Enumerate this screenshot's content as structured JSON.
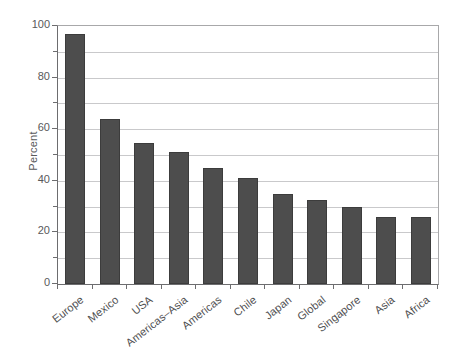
{
  "chart_data": {
    "type": "bar",
    "title": "",
    "subtitle": "",
    "xlabel": "",
    "ylabel": "Percent",
    "categories": [
      "Europe",
      "Mexico",
      "USA",
      "Americas–Asia",
      "Americas",
      "Chile",
      "Japan",
      "Global",
      "Singapore",
      "Asia",
      "Africa"
    ],
    "values": [
      97,
      64,
      54.5,
      51,
      45,
      41,
      35,
      32.5,
      30,
      26,
      26
    ],
    "ylim": [
      0,
      100
    ],
    "xlim_categories": 11,
    "y_major_ticks": [
      0,
      20,
      40,
      60,
      80,
      100
    ],
    "y_minor_ticks": [
      10,
      30,
      50,
      70,
      90
    ],
    "y_tick_labels": [
      "0",
      "20",
      "40",
      "60",
      "80",
      "100"
    ],
    "gridlines": "horizontal-every-10",
    "grid": true,
    "legend": "none",
    "series": [
      {
        "name": "Percent",
        "values": [
          97,
          64,
          54.5,
          51,
          45,
          41,
          35,
          32.5,
          30,
          26,
          26
        ]
      }
    ],
    "colors": {
      "bar_fill": "#4d4d4d",
      "bar_edge": "#3c3c3c",
      "gridline": "#c9c9cb",
      "axis": "#6d6d6f",
      "text": "#59595b",
      "background": "#ffffff"
    },
    "annotations": []
  }
}
